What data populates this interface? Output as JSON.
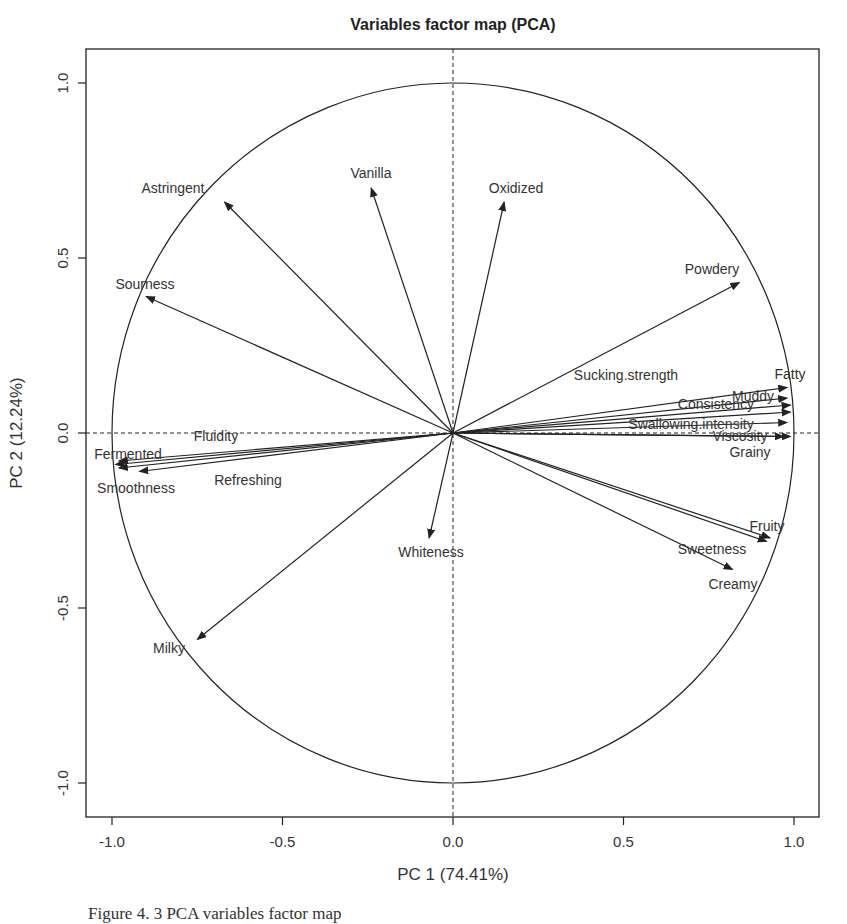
{
  "chart_data": {
    "type": "scatter",
    "subtype": "pca-variable-correlation-circle",
    "title": "Variables factor map (PCA)",
    "xlabel": "PC 1 (74.41%)",
    "ylabel": "PC 2 (12.24%)",
    "xlim": [
      -1.1,
      1.1
    ],
    "ylim": [
      -1.1,
      1.1
    ],
    "xticks": [
      "-1.0",
      "-0.5",
      "0.0",
      "0.5",
      "1.0"
    ],
    "yticks": [
      "-1.0",
      "-0.5",
      "0.0",
      "0.5",
      "1.0"
    ],
    "unit_circle": true,
    "reference_lines": [
      "x=0 dashed",
      "y=0 dashed"
    ],
    "grid": false,
    "legend": null,
    "variables": [
      {
        "name": "Astringent",
        "x": -0.67,
        "y": 0.66,
        "lx": 173,
        "ly": 188
      },
      {
        "name": "Vanilla",
        "x": -0.24,
        "y": 0.7,
        "lx": 371,
        "ly": 173
      },
      {
        "name": "Oxidized",
        "x": 0.15,
        "y": 0.66,
        "lx": 516,
        "ly": 188
      },
      {
        "name": "Powdery",
        "x": 0.84,
        "y": 0.43,
        "lx": 712,
        "ly": 269
      },
      {
        "name": "Sourness",
        "x": -0.9,
        "y": 0.39,
        "lx": 145,
        "ly": 284
      },
      {
        "name": "Fatty",
        "x": 0.98,
        "y": 0.13,
        "lx": 790,
        "ly": 374
      },
      {
        "name": "Sucking.strength",
        "x": 0.99,
        "y": 0.06,
        "lx": 626,
        "ly": 375
      },
      {
        "name": "Muddy",
        "x": 0.98,
        "y": 0.1,
        "lx": 753,
        "ly": 396
      },
      {
        "name": "Consistency",
        "x": 0.99,
        "y": 0.08,
        "lx": 716,
        "ly": 404
      },
      {
        "name": "Swallowing.intensity",
        "x": 0.98,
        "y": 0.03,
        "lx": 691,
        "ly": 424
      },
      {
        "name": "Viscosity",
        "x": 0.97,
        "y": -0.01,
        "lx": 740,
        "ly": 436
      },
      {
        "name": "Grainy",
        "x": 0.99,
        "y": -0.01,
        "lx": 750,
        "ly": 452
      },
      {
        "name": "Fluidity",
        "x": -0.98,
        "y": -0.08,
        "lx": 216,
        "ly": 436
      },
      {
        "name": "Fermented",
        "x": -0.99,
        "y": -0.09,
        "lx": 128,
        "ly": 454
      },
      {
        "name": "Smoothness",
        "x": -0.98,
        "y": -0.1,
        "lx": 136,
        "ly": 488
      },
      {
        "name": "Refreshing",
        "x": -0.92,
        "y": -0.11,
        "lx": 248,
        "ly": 480
      },
      {
        "name": "Fruity",
        "x": 0.93,
        "y": -0.3,
        "lx": 767,
        "ly": 526
      },
      {
        "name": "Sweetness",
        "x": 0.92,
        "y": -0.31,
        "lx": 712,
        "ly": 549
      },
      {
        "name": "Creamy",
        "x": 0.82,
        "y": -0.39,
        "lx": 733,
        "ly": 584
      },
      {
        "name": "Whiteness",
        "x": -0.07,
        "y": -0.3,
        "lx": 431,
        "ly": 552
      },
      {
        "name": "Milky",
        "x": -0.75,
        "y": -0.59,
        "lx": 169,
        "ly": 648
      }
    ]
  },
  "caption": "Figure 4. 3 PCA variables factor map"
}
